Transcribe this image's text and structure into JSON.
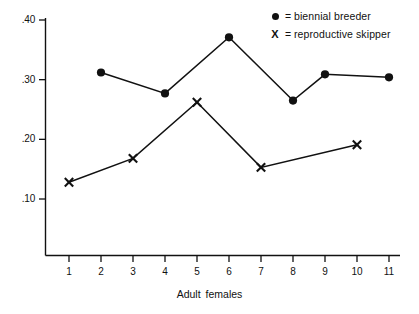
{
  "chart_data": {
    "type": "line",
    "title": "",
    "xlabel": "Adult  females",
    "ylabel": "",
    "xlim": [
      0.5,
      11.5
    ],
    "ylim": [
      0.085,
      0.415
    ],
    "grid": false,
    "legend_position": "top-right",
    "x_ticks": [
      1,
      2,
      3,
      4,
      5,
      6,
      7,
      8,
      9,
      10,
      11
    ],
    "x_tick_labels": [
      "1",
      "2",
      "3",
      "4",
      "5",
      "6",
      "7",
      "8",
      "9",
      "10",
      "11"
    ],
    "y_ticks": [
      0.1,
      0.2,
      0.3,
      0.4
    ],
    "y_tick_labels": [
      ".10",
      ".20",
      ".30",
      ".40"
    ],
    "series": [
      {
        "name": "biennial breeder",
        "marker": "filled-circle",
        "color": "#111111",
        "x": [
          2,
          4,
          6,
          8,
          9,
          11
        ],
        "values": [
          0.312,
          0.277,
          0.371,
          0.265,
          0.309,
          0.304
        ]
      },
      {
        "name": "reproductive skipper",
        "marker": "x",
        "color": "#111111",
        "x": [
          1,
          3,
          5,
          7,
          10
        ],
        "values": [
          0.128,
          0.168,
          0.262,
          0.153,
          0.191
        ]
      }
    ]
  },
  "legend": {
    "items": [
      {
        "marker": "filled-circle",
        "equals": "=",
        "label": "biennial breeder"
      },
      {
        "marker": "X",
        "equals": "=",
        "label": "reproductive skipper"
      }
    ]
  },
  "axes": {
    "x_title_part1": "Adult",
    "x_title_part2": "females"
  }
}
